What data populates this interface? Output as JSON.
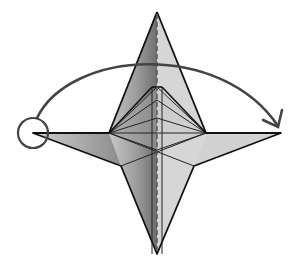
{
  "diagram": {
    "type": "origami-fold-step",
    "colors": {
      "background": "#ffffff",
      "paper_light": "#d4d4d4",
      "paper_dark": "#8a8a8a",
      "line": "#111111",
      "arrow": "#444444"
    },
    "points": {
      "top_tip": [
        157,
        12
      ],
      "bottom_tip": [
        157,
        254
      ],
      "left_tip": [
        33,
        133
      ],
      "right_tip": [
        281,
        133
      ],
      "left_inner": [
        109,
        133
      ],
      "right_inner": [
        206,
        133
      ],
      "upper_inner_apex": [
        157,
        87
      ],
      "lower_left_notch": [
        121,
        166
      ],
      "lower_right_notch": [
        194,
        166
      ]
    },
    "annotations": {
      "start_marker": "circle",
      "fold_arrow": "left-point-to-right-point",
      "center_line": "dashed-valley-fold"
    }
  }
}
